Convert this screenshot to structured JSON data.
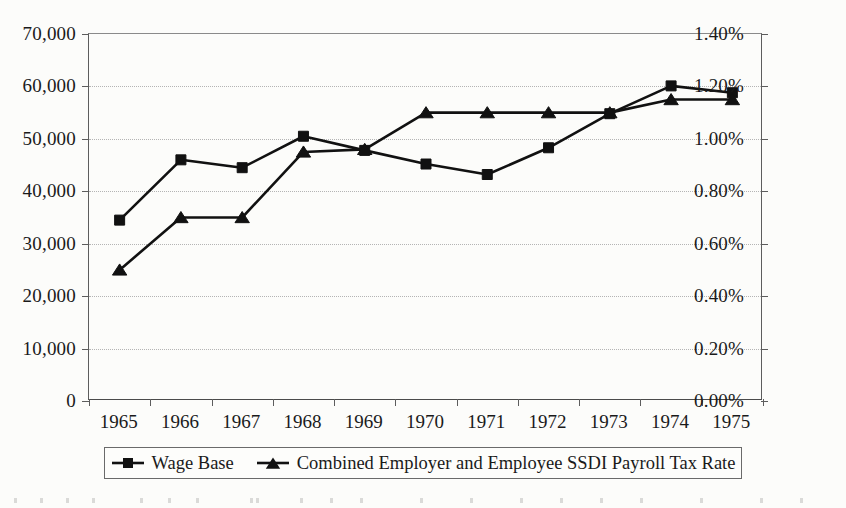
{
  "chart_data": {
    "type": "line",
    "title": "",
    "subtitle": "",
    "xlabel": "",
    "ylabel": "",
    "grid": true,
    "legend_position": "bottom",
    "categories": [
      "1965",
      "1966",
      "1967",
      "1968",
      "1969",
      "1970",
      "1971",
      "1972",
      "1973",
      "1974",
      "1975"
    ],
    "axes": {
      "left": {
        "label": "",
        "min": 0,
        "max": 70000,
        "step": 10000,
        "tick_labels": [
          "0",
          "10,000",
          "20,000",
          "30,000",
          "40,000",
          "50,000",
          "60,000",
          "70,000"
        ],
        "tick_values": [
          0,
          10000,
          20000,
          30000,
          40000,
          50000,
          60000,
          70000
        ]
      },
      "right": {
        "label": "",
        "min": 0,
        "max": 1.4,
        "step": 0.2,
        "tick_labels": [
          "0.00%",
          "0.20%",
          "0.40%",
          "0.60%",
          "0.80%",
          "1.00%",
          "1.20%",
          "1.40%"
        ],
        "tick_values": [
          0,
          0.2,
          0.4,
          0.6,
          0.8,
          1.0,
          1.2,
          1.4
        ]
      }
    },
    "series": [
      {
        "name": "Wage Base",
        "axis": "left",
        "marker": "square",
        "color": "#111111",
        "values": [
          34500,
          46000,
          44500,
          50500,
          47800,
          45200,
          43200,
          48300,
          54800,
          60100,
          58800
        ]
      },
      {
        "name": "Combined Employer and Employee SSDI Payroll Tax Rate",
        "axis": "right",
        "marker": "triangle",
        "color": "#111111",
        "values": [
          0.5,
          0.7,
          0.7,
          0.95,
          0.96,
          1.1,
          1.1,
          1.1,
          1.1,
          1.15,
          1.15
        ]
      }
    ]
  },
  "legend": {
    "entries": [
      {
        "label": "Wage Base",
        "marker": "square"
      },
      {
        "label": "Combined Employer and Employee SSDI Payroll Tax Rate",
        "marker": "triangle"
      }
    ]
  },
  "colors": {
    "ink": "#111111",
    "axis": "#5d5d5d",
    "grid": "#b4b4b4",
    "page": "#fcfcfa"
  }
}
